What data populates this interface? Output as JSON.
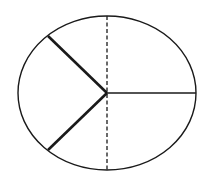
{
  "diagram": {
    "type": "ellipse-divided-into-sectors",
    "colors": {
      "background": "#ffffff",
      "stroke": "#1a1a1a"
    },
    "ellipse": {
      "cx": 107,
      "cy": 93,
      "rx": 89,
      "ry": 77
    },
    "center": {
      "x": 107,
      "y": 93
    },
    "segments": [
      {
        "name": "radius-upper-left",
        "x2": 48,
        "y2": 36,
        "style": "thick"
      },
      {
        "name": "radius-lower-left",
        "x2": 48,
        "y2": 150,
        "style": "thick"
      },
      {
        "name": "radius-right",
        "x2": 196,
        "y2": 93,
        "style": "thin"
      }
    ],
    "dashed_axis": {
      "x": 107,
      "y1": 16,
      "y2": 170
    }
  }
}
